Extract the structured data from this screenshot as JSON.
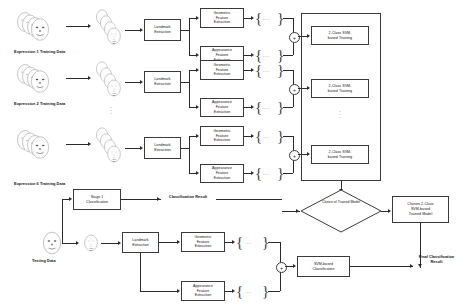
{
  "diagram": {
    "type": "flowchart",
    "colors": {
      "stroke": "#3a3a3a",
      "line": "#2a2a2a",
      "text": "#111111",
      "background": "#ffffff"
    },
    "training_rows": [
      {
        "data_label": "Expression 1 Training Data",
        "landmark_box": "Landmark\nExtraction",
        "landmark_l1": "Landmark",
        "landmark_l2": "Extraction",
        "geo_l1": "Geometric",
        "geo_l2": "Feature",
        "geo_l3": "Extraction",
        "app_l1": "Appearance",
        "app_l2": "Feature",
        "app_l3": "Extraction",
        "geo_dots": "....",
        "app_dots": "....",
        "concat_symbol": "+",
        "svm_l1": "2-Class SVM-",
        "svm_l2": "based Training",
        "apex_caption": "Apex\n2F"
      },
      {
        "data_label": "Expression 2 Training Data",
        "landmark_l1": "Landmark",
        "landmark_l2": "Extraction",
        "geo_l1": "Geometric",
        "geo_l2": "Feature",
        "geo_l3": "Extraction",
        "app_l1": "Appearance",
        "app_l2": "Feature",
        "app_l3": "Extraction",
        "geo_dots": "....",
        "app_dots": "....",
        "concat_symbol": "+",
        "svm_l1": "2-Class SVM-",
        "svm_l2": "based Training",
        "apex_caption": "Apex\n2F"
      },
      {
        "data_label": "Expression 6 Training Data",
        "landmark_l1": "Landmark",
        "landmark_l2": "Extraction",
        "geo_l1": "Geometric",
        "geo_l2": "Feature",
        "geo_l3": "Extraction",
        "app_l1": "Appearance",
        "app_l2": "Feature",
        "app_l3": "Extraction",
        "geo_dots": "....",
        "app_dots": "....",
        "concat_symbol": "+",
        "svm_l1": "2-Class SVM-",
        "svm_l2": "based Training",
        "apex_caption": "Apex\n2F"
      }
    ],
    "vertical_ellipsis_training": "·\n·\n·",
    "vertical_ellipsis_data": "·",
    "choice": {
      "l1": "Choice of",
      "l2": "Trained",
      "l3": "Model"
    },
    "chosen_model": {
      "l1": "Chosen 2-Class",
      "l2": "SVM-based",
      "l3": "Trained Model"
    },
    "stage1": {
      "l1": "Stage 1",
      "l2": "Classification"
    },
    "stage1_result": {
      "l1": "Classification",
      "l2": "Result"
    },
    "testing": {
      "data_label": "Testing Data",
      "landmark_l1": "Landmark",
      "landmark_l2": "Extraction",
      "geo_l1": "Geometric",
      "geo_l2": "Feature",
      "geo_l3": "Extraction",
      "app_l1": "Appearance",
      "app_l2": "Feature",
      "app_l3": "Extraction",
      "geo_dots": "....",
      "app_dots": "....",
      "concat_symbol": "+",
      "svm_l1": "SVM-based",
      "svm_l2": "Classification",
      "apex_caption": "Apex\n2F"
    },
    "final_result": {
      "l1": "Final",
      "l2": "Classification",
      "l3": "Result"
    }
  }
}
